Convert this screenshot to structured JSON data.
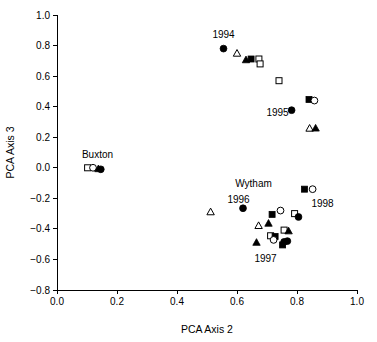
{
  "chart_data": {
    "type": "scatter",
    "title": "",
    "xlabel": "PCA Axis 2",
    "ylabel": "PCA Axis 3",
    "xlim": [
      0.0,
      1.0
    ],
    "ylim": [
      -0.8,
      1.0
    ],
    "xticks": [
      "0.0",
      "0.2",
      "0.4",
      "0.6",
      "0.8",
      "1.0"
    ],
    "xtickvalues": [
      0.0,
      0.2,
      0.4,
      0.6,
      0.8,
      1.0
    ],
    "yticks": [
      "1.0",
      "0.8",
      "0.6",
      "0.4",
      "0.2",
      "0.0",
      "−0.2",
      "−0.4",
      "−0.6",
      "−0.8"
    ],
    "ytickvalues": [
      1.0,
      0.8,
      0.6,
      0.4,
      0.2,
      0.0,
      -0.2,
      -0.4,
      -0.6,
      -0.8
    ],
    "grid": false,
    "legend": "none",
    "marker_types": [
      "filled-circle",
      "open-circle",
      "filled-square",
      "open-square",
      "filled-triangle",
      "open-triangle"
    ],
    "annotations": [
      {
        "text": "1994",
        "x": 0.555,
        "y": 0.875,
        "anchor": "middle"
      },
      {
        "text": "1995",
        "x": 0.735,
        "y": 0.365,
        "anchor": "middle"
      },
      {
        "text": "Buxton",
        "x": 0.135,
        "y": 0.085,
        "anchor": "middle"
      },
      {
        "text": "Wytham",
        "x": 0.655,
        "y": -0.105,
        "anchor": "middle"
      },
      {
        "text": "1996",
        "x": 0.605,
        "y": -0.205,
        "anchor": "middle"
      },
      {
        "text": "1997",
        "x": 0.695,
        "y": -0.595,
        "anchor": "middle"
      },
      {
        "text": "1998",
        "x": 0.885,
        "y": -0.235,
        "anchor": "middle"
      }
    ],
    "points": [
      {
        "x": 0.555,
        "y": 0.78,
        "marker": "filled-circle"
      },
      {
        "x": 0.6,
        "y": 0.748,
        "marker": "open-triangle"
      },
      {
        "x": 0.63,
        "y": 0.705,
        "marker": "filled-triangle"
      },
      {
        "x": 0.647,
        "y": 0.712,
        "marker": "filled-square"
      },
      {
        "x": 0.673,
        "y": 0.712,
        "marker": "open-square"
      },
      {
        "x": 0.677,
        "y": 0.68,
        "marker": "open-square"
      },
      {
        "x": 0.74,
        "y": 0.57,
        "marker": "open-square"
      },
      {
        "x": 0.84,
        "y": 0.447,
        "marker": "filled-square"
      },
      {
        "x": 0.858,
        "y": 0.44,
        "marker": "open-circle"
      },
      {
        "x": 0.782,
        "y": 0.377,
        "marker": "filled-circle"
      },
      {
        "x": 0.842,
        "y": 0.257,
        "marker": "open-triangle"
      },
      {
        "x": 0.862,
        "y": 0.258,
        "marker": "filled-triangle"
      },
      {
        "x": 0.102,
        "y": 0.0,
        "marker": "open-square"
      },
      {
        "x": 0.12,
        "y": 0.0,
        "marker": "open-circle"
      },
      {
        "x": 0.138,
        "y": -0.008,
        "marker": "filled-triangle"
      },
      {
        "x": 0.146,
        "y": -0.01,
        "marker": "filled-circle"
      },
      {
        "x": 0.825,
        "y": -0.14,
        "marker": "filled-square"
      },
      {
        "x": 0.852,
        "y": -0.14,
        "marker": "open-circle"
      },
      {
        "x": 0.512,
        "y": -0.29,
        "marker": "open-triangle"
      },
      {
        "x": 0.62,
        "y": -0.265,
        "marker": "filled-circle"
      },
      {
        "x": 0.717,
        "y": -0.305,
        "marker": "filled-square"
      },
      {
        "x": 0.745,
        "y": -0.28,
        "marker": "open-circle"
      },
      {
        "x": 0.792,
        "y": -0.3,
        "marker": "open-square"
      },
      {
        "x": 0.805,
        "y": -0.322,
        "marker": "filled-circle"
      },
      {
        "x": 0.672,
        "y": -0.38,
        "marker": "open-triangle"
      },
      {
        "x": 0.705,
        "y": -0.365,
        "marker": "filled-triangle"
      },
      {
        "x": 0.757,
        "y": -0.408,
        "marker": "open-square"
      },
      {
        "x": 0.772,
        "y": -0.415,
        "marker": "filled-triangle"
      },
      {
        "x": 0.712,
        "y": -0.445,
        "marker": "open-square"
      },
      {
        "x": 0.727,
        "y": -0.45,
        "marker": "filled-square"
      },
      {
        "x": 0.665,
        "y": -0.49,
        "marker": "filled-triangle"
      },
      {
        "x": 0.722,
        "y": -0.472,
        "marker": "open-circle"
      },
      {
        "x": 0.757,
        "y": -0.485,
        "marker": "filled-circle"
      },
      {
        "x": 0.768,
        "y": -0.48,
        "marker": "filled-circle"
      },
      {
        "x": 0.752,
        "y": -0.505,
        "marker": "filled-square"
      }
    ]
  }
}
